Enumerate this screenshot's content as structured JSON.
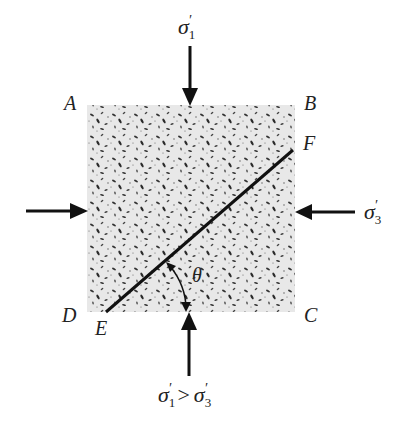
{
  "diagram": {
    "type": "soil-element-triaxial-stress",
    "corners": {
      "top_left": "A",
      "top_right": "B",
      "bottom_right": "C",
      "bottom_left": "D"
    },
    "failure_plane_ends": {
      "lower": "E",
      "upper": "F"
    },
    "angle_label": "θ",
    "stresses": {
      "top": {
        "symbol": "σ",
        "subscript": "1",
        "prime": "′"
      },
      "right": {
        "symbol": "σ",
        "subscript": "3",
        "prime": "′"
      },
      "bottom_condition": {
        "left": {
          "symbol": "σ",
          "subscript": "1",
          "prime": "′"
        },
        "operator": ">",
        "right": {
          "symbol": "σ",
          "subscript": "3",
          "prime": "′"
        }
      }
    },
    "colors": {
      "element_fill": "#e6e6e6",
      "grain": "#333333",
      "line": "#111111"
    }
  }
}
